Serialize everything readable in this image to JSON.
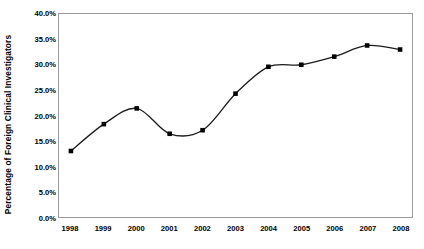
{
  "chart_data": {
    "type": "line",
    "title": "",
    "subtitle": "",
    "xlabel": "",
    "ylabel": "Percentage of Foreign Clinical Investigators",
    "categories": [
      "1998",
      "1999",
      "2000",
      "2001",
      "2002",
      "2003",
      "2004",
      "2005",
      "2006",
      "2007",
      "2008"
    ],
    "values": [
      13.0,
      18.3,
      21.4,
      16.4,
      17.1,
      24.3,
      29.6,
      30.0,
      31.6,
      33.8,
      33.0
    ],
    "series": [
      {
        "name": "Percentage of Foreign Clinical Investigators",
        "values": [
          13.0,
          18.3,
          21.4,
          16.4,
          17.1,
          24.3,
          29.6,
          30.0,
          31.6,
          33.8,
          33.0
        ]
      }
    ],
    "ylim": [
      0,
      40
    ],
    "ytick_values": [
      0,
      5,
      10,
      15,
      20,
      25,
      30,
      35,
      40
    ],
    "ytick_labels": [
      "0.0%",
      "5.0%",
      "10.0%",
      "15.0%",
      "20.0%",
      "25.0%",
      "30.0%",
      "35.0%",
      "40.0%"
    ],
    "xtick_labels": [
      "1998",
      "1999",
      "2000",
      "2001",
      "2002",
      "2003",
      "2004",
      "2005",
      "2006",
      "2007",
      "2008"
    ],
    "grid": false,
    "legend": "none",
    "line_color": "#1a1a1a",
    "marker_color": "#000000",
    "marker_shape": "square",
    "frame_color": "#9a9a9a",
    "background_color": "#ffffff",
    "smoothed": true
  }
}
